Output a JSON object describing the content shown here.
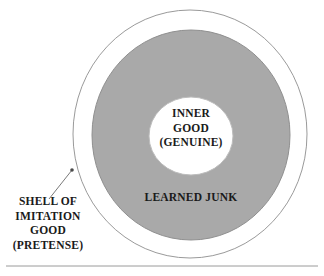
{
  "diagram": {
    "type": "concentric-circles",
    "title_present": false,
    "background_color": "#ffffff",
    "text_color": "#1a1a1a",
    "shapes": {
      "outer_circle": {
        "name": "outer-boundary-circle",
        "fill": "#ffffff",
        "stroke": "#9a9a9a",
        "stroke_width": 1,
        "center_x": 190,
        "center_y": 134,
        "radius_x": 117,
        "radius_y": 124
      },
      "middle_circle": {
        "name": "learned-junk-ring",
        "fill": "#a9a9a9",
        "stroke": "#8f8f8f",
        "stroke_width": 1,
        "center_x": 191,
        "center_y": 135,
        "radius_x": 99,
        "radius_y": 105
      },
      "inner_circle": {
        "name": "inner-good-circle",
        "fill": "#ffffff",
        "stroke": "#bdbdbd",
        "stroke_width": 1,
        "center_x": 191,
        "center_y": 136,
        "radius_x": 42,
        "radius_y": 39
      }
    },
    "leader_line": {
      "name": "shell-leader-line",
      "stroke": "#7a7a7a",
      "stroke_width": 1,
      "x1": 49,
      "y1": 199,
      "x2": 72,
      "y2": 170,
      "dot_radius": 1.8
    },
    "bottom_rule": {
      "name": "bottom-divider-rule",
      "stroke": "#9a9a9a",
      "stroke_width": 1,
      "x1": 6,
      "y1": 266,
      "x2": 318,
      "y2": 266
    },
    "labels": {
      "inner": {
        "name": "inner-good-label",
        "lines": [
          "INNER",
          "GOOD",
          "(GENUINE)"
        ]
      },
      "ring": {
        "name": "learned-junk-label",
        "lines": [
          "LEARNED JUNK"
        ]
      },
      "shell": {
        "name": "shell-of-imitation-good-label",
        "lines": [
          "SHELL OF",
          "IMITATION",
          "GOOD",
          "(PRETENSE)"
        ]
      }
    }
  }
}
